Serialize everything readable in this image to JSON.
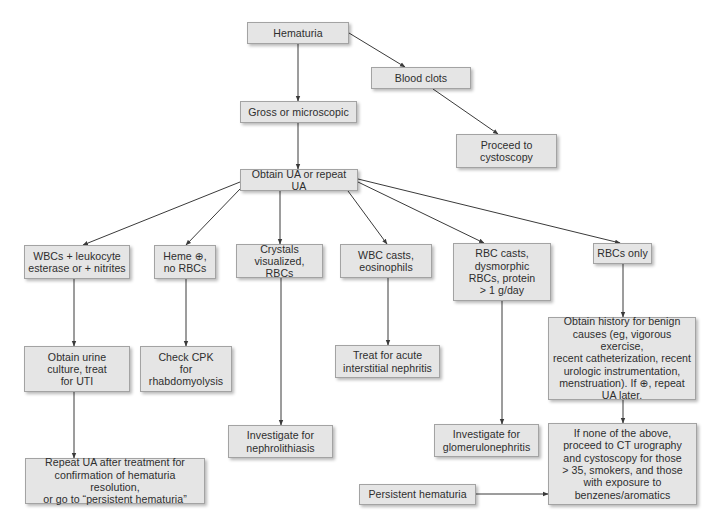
{
  "diagram": {
    "type": "flowchart",
    "topic": "Hematuria evaluation",
    "colors": {
      "background": "#ffffff",
      "node_fill": "#e5e5e5",
      "node_border": "#a3a3a3",
      "text": "#2e2e2e",
      "edge": "#3a3a3a"
    },
    "nodes": [
      {
        "id": "hematuria",
        "label": "Hematuria",
        "x": 247,
        "y": 22,
        "w": 102,
        "h": 22
      },
      {
        "id": "blood_clots",
        "label": "Blood clots",
        "x": 371,
        "y": 67,
        "w": 100,
        "h": 22
      },
      {
        "id": "gross_micro",
        "label": "Gross or microscopic",
        "x": 240,
        "y": 101,
        "w": 117,
        "h": 22
      },
      {
        "id": "proceed_cysto",
        "label": "Proceed to\ncystoscopy",
        "x": 456,
        "y": 134,
        "w": 101,
        "h": 34
      },
      {
        "id": "obtain_ua",
        "label": "Obtain UA or repeat UA",
        "x": 240,
        "y": 169,
        "w": 118,
        "h": 22
      },
      {
        "id": "wbc_le",
        "label": "WBCs + leukocyte\nesterase or + nitrites",
        "x": 24,
        "y": 245,
        "w": 106,
        "h": 34
      },
      {
        "id": "heme_pos",
        "label": "Heme ⊕,\nno RBCs",
        "x": 154,
        "y": 245,
        "w": 62,
        "h": 34
      },
      {
        "id": "crystals",
        "label": "Crystals\nvisualized, RBCs",
        "x": 236,
        "y": 244,
        "w": 87,
        "h": 34
      },
      {
        "id": "wbc_casts",
        "label": "WBC casts,\neosinophils",
        "x": 340,
        "y": 244,
        "w": 92,
        "h": 34
      },
      {
        "id": "rbc_casts",
        "label": "RBC casts,\ndysmorphic\nRBCs, protein\n> 1 g/day",
        "x": 453,
        "y": 243,
        "w": 98,
        "h": 58
      },
      {
        "id": "rbcs_only",
        "label": "RBCs only",
        "x": 593,
        "y": 243,
        "w": 59,
        "h": 21
      },
      {
        "id": "urine_culture",
        "label": "Obtain urine\nculture, treat\nfor UTI",
        "x": 24,
        "y": 346,
        "w": 106,
        "h": 46
      },
      {
        "id": "check_cpk",
        "label": "Check CPK\nfor\nrhabdomyolysis",
        "x": 140,
        "y": 346,
        "w": 92,
        "h": 46
      },
      {
        "id": "treat_ain",
        "label": "Treat for acute\ninterstitial nephritis",
        "x": 335,
        "y": 345,
        "w": 105,
        "h": 33
      },
      {
        "id": "obtain_history",
        "label": "Obtain history for benign\ncauses (eg, vigorous exercise,\nrecent catheterization, recent\nurologic instrumentation,\nmenstruation). If ⊕, repeat\nUA later.",
        "x": 548,
        "y": 317,
        "w": 148,
        "h": 83
      },
      {
        "id": "investigate_nephro",
        "label": "Investigate for\nnephrolithiasis",
        "x": 228,
        "y": 425,
        "w": 105,
        "h": 33
      },
      {
        "id": "investigate_glom",
        "label": "Investigate for\nglomerulonephritis",
        "x": 434,
        "y": 424,
        "w": 105,
        "h": 33
      },
      {
        "id": "if_none",
        "label": "If none of the above,\nproceed to CT urography\nand cystoscopy for those\n> 35, smokers, and those\nwith exposure to\nbenzenes/aromatics",
        "x": 548,
        "y": 423,
        "w": 149,
        "h": 82
      },
      {
        "id": "repeat_ua",
        "label": "Repeat UA after treatment for\nconfirmation of hematuria resolution,\nor go to “persistent hematuria”",
        "x": 25,
        "y": 458,
        "w": 180,
        "h": 46
      },
      {
        "id": "persistent",
        "label": "Persistent hematuria",
        "x": 359,
        "y": 484,
        "w": 117,
        "h": 21
      }
    ],
    "edges": [
      {
        "from": "hematuria",
        "to": "gross_micro",
        "x1": 298,
        "y1": 44,
        "x2": 298,
        "y2": 101
      },
      {
        "from": "hematuria",
        "to": "blood_clots",
        "x1": 349,
        "y1": 33,
        "x2": 405,
        "y2": 67
      },
      {
        "from": "blood_clots",
        "to": "proceed_cysto",
        "x1": 433,
        "y1": 89,
        "x2": 498,
        "y2": 134
      },
      {
        "from": "gross_micro",
        "to": "obtain_ua",
        "x1": 298,
        "y1": 123,
        "x2": 298,
        "y2": 169
      },
      {
        "from": "obtain_ua",
        "to": "wbc_le",
        "x1": 240,
        "y1": 182,
        "x2": 83,
        "y2": 245
      },
      {
        "from": "obtain_ua",
        "to": "heme_pos",
        "x1": 240,
        "y1": 189,
        "x2": 186,
        "y2": 245
      },
      {
        "from": "obtain_ua",
        "to": "crystals",
        "x1": 280,
        "y1": 191,
        "x2": 280,
        "y2": 244
      },
      {
        "from": "obtain_ua",
        "to": "wbc_casts",
        "x1": 348,
        "y1": 191,
        "x2": 387,
        "y2": 244
      },
      {
        "from": "obtain_ua",
        "to": "rbc_casts",
        "x1": 358,
        "y1": 182,
        "x2": 484,
        "y2": 243
      },
      {
        "from": "obtain_ua",
        "to": "rbcs_only",
        "x1": 358,
        "y1": 179,
        "x2": 620,
        "y2": 243
      },
      {
        "from": "wbc_le",
        "to": "urine_culture",
        "x1": 74,
        "y1": 279,
        "x2": 74,
        "y2": 346
      },
      {
        "from": "heme_pos",
        "to": "check_cpk",
        "x1": 186,
        "y1": 279,
        "x2": 186,
        "y2": 346
      },
      {
        "from": "crystals",
        "to": "investigate_nephro",
        "x1": 281,
        "y1": 278,
        "x2": 281,
        "y2": 425
      },
      {
        "from": "wbc_casts",
        "to": "treat_ain",
        "x1": 388,
        "y1": 278,
        "x2": 388,
        "y2": 345
      },
      {
        "from": "rbc_casts",
        "to": "investigate_glom",
        "x1": 502,
        "y1": 301,
        "x2": 502,
        "y2": 424
      },
      {
        "from": "rbcs_only",
        "to": "obtain_history",
        "x1": 623,
        "y1": 264,
        "x2": 623,
        "y2": 317
      },
      {
        "from": "obtain_history",
        "to": "if_none",
        "x1": 623,
        "y1": 400,
        "x2": 623,
        "y2": 423
      },
      {
        "from": "urine_culture",
        "to": "repeat_ua",
        "x1": 74,
        "y1": 392,
        "x2": 74,
        "y2": 458
      },
      {
        "from": "persistent",
        "to": "if_none",
        "x1": 476,
        "y1": 494,
        "x2": 548,
        "y2": 494
      }
    ]
  }
}
